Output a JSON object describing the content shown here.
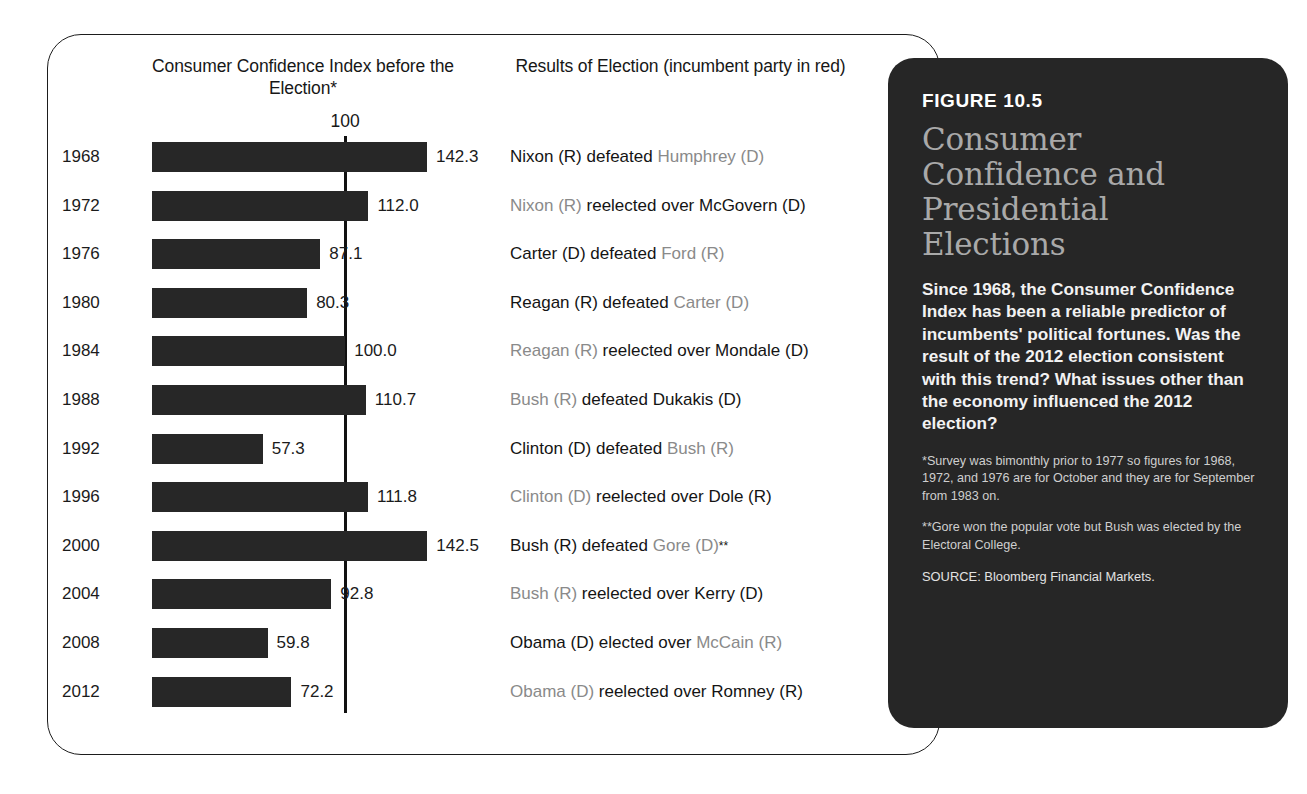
{
  "figure": {
    "number": "FIGURE 10.5",
    "title": "Consumer Confidence and Presidential Elections",
    "body": "Since 1968, the Consumer Confidence Index has been a reliable predictor of incumbents' political fortunes. Was the result of the 2012 election consistent with this trend? What issues other than the economy influenced the 2012 election?",
    "note_1": "*Survey was bimonthly prior to 1977 so figures for 1968, 1972, and 1976 are for October and they are for September from 1983 on.",
    "note_2": "**Gore won the popular vote but Bush was elected by the Electoral College.",
    "source": "SOURCE: Bloomberg Financial Markets.",
    "colors": {
      "panel_background": "#262626",
      "title_text": "#a9a9a9",
      "bar_fill": "#272727",
      "incumbent_text": "#8a8a8a"
    }
  },
  "chart_heading": "Consumer Confidence Index before the Election*",
  "results_heading": "Results of Election (incumbent party in red)",
  "chart_data": {
    "type": "bar",
    "title": "Consumer Confidence Index before the Election*",
    "xlabel": "",
    "ylabel": "",
    "orientation": "horizontal",
    "reference_line": 100,
    "reference_line_label": "100",
    "axis_min": 0,
    "axis_max": 150,
    "grid": false,
    "categories": [
      "1968",
      "1972",
      "1976",
      "1980",
      "1984",
      "1988",
      "1992",
      "1996",
      "2000",
      "2004",
      "2008",
      "2012"
    ],
    "values": [
      142.3,
      112.0,
      87.1,
      80.3,
      100.0,
      110.7,
      57.3,
      111.8,
      142.5,
      92.8,
      59.8,
      72.2
    ],
    "value_labels": [
      "142.3",
      "112.0",
      "87.1",
      "80.3",
      "100.0",
      "110.7",
      "57.3",
      "111.8",
      "142.5",
      "92.8",
      "59.8",
      "72.2"
    ]
  },
  "election_results": [
    {
      "year": "1968",
      "winner": "Nixon (R)",
      "verb": "defeated",
      "loser": "Humphrey (D)",
      "incumbent_side": "loser",
      "footnote": ""
    },
    {
      "year": "1972",
      "winner": "Nixon (R)",
      "verb": "reelected over",
      "loser": "McGovern (D)",
      "incumbent_side": "winner",
      "footnote": ""
    },
    {
      "year": "1976",
      "winner": "Carter (D)",
      "verb": "defeated",
      "loser": "Ford (R)",
      "incumbent_side": "loser",
      "footnote": ""
    },
    {
      "year": "1980",
      "winner": "Reagan (R)",
      "verb": "defeated",
      "loser": "Carter (D)",
      "incumbent_side": "loser",
      "footnote": ""
    },
    {
      "year": "1984",
      "winner": "Reagan (R)",
      "verb": "reelected over",
      "loser": "Mondale (D)",
      "incumbent_side": "winner",
      "footnote": ""
    },
    {
      "year": "1988",
      "winner": "Bush (R)",
      "verb": "defeated",
      "loser": "Dukakis (D)",
      "incumbent_side": "winner",
      "footnote": ""
    },
    {
      "year": "1992",
      "winner": "Clinton (D)",
      "verb": "defeated",
      "loser": "Bush (R)",
      "incumbent_side": "loser",
      "footnote": ""
    },
    {
      "year": "1996",
      "winner": "Clinton (D)",
      "verb": "reelected over",
      "loser": "Dole (R)",
      "incumbent_side": "winner",
      "footnote": ""
    },
    {
      "year": "2000",
      "winner": "Bush (R)",
      "verb": "defeated",
      "loser": "Gore (D)",
      "incumbent_side": "loser",
      "footnote": "**"
    },
    {
      "year": "2004",
      "winner": "Bush (R)",
      "verb": "reelected over",
      "loser": "Kerry (D)",
      "incumbent_side": "winner",
      "footnote": ""
    },
    {
      "year": "2008",
      "winner": "Obama (D)",
      "verb": "elected over",
      "loser": "McCain (R)",
      "incumbent_side": "loser",
      "footnote": ""
    },
    {
      "year": "2012",
      "winner": "Obama (D)",
      "verb": "reelected over",
      "loser": "Romney (R)",
      "incumbent_side": "winner",
      "footnote": ""
    }
  ]
}
